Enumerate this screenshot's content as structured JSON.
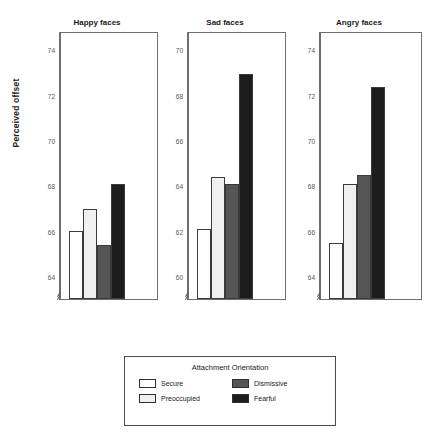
{
  "chart_data": {
    "type": "bar",
    "title": "",
    "xlabel": "",
    "ylabel": "Perceived offset",
    "grid": false,
    "legend_position": "bottom",
    "legend_title": "Attachment Orientation",
    "categories": [
      "Happy faces",
      "Sad faces",
      "Angry faces"
    ],
    "series": [
      {
        "name": "Secure",
        "values": [
          66.0,
          62.1,
          65.5
        ],
        "fill": "white",
        "color": "#ffffff"
      },
      {
        "name": "Preoccupied",
        "values": [
          67.0,
          64.4,
          68.1
        ],
        "fill": "light-stipple",
        "color": "#f0f0f0"
      },
      {
        "name": "Dismissive",
        "values": [
          65.4,
          64.1,
          68.5
        ],
        "fill": "gray-stipple",
        "color": "#9a9a9a"
      },
      {
        "name": "Fearful",
        "values": [
          68.1,
          69.0,
          72.4
        ],
        "fill": "dark-stipple",
        "color": "#1d1d1d"
      }
    ],
    "panels": [
      {
        "label": "Happy faces",
        "ylim": [
          63.0,
          74.8
        ],
        "yticks": [
          64,
          66,
          68,
          70,
          72,
          74
        ],
        "yticklabels": [
          "64",
          "66",
          "68",
          "70",
          "72",
          "74"
        ],
        "minor_ticks": [
          65,
          67,
          69,
          71,
          73
        ],
        "axis_break": true,
        "values": {
          "Secure": 66.0,
          "Preoccupied": 67.0,
          "Dismissive": 65.4,
          "Fearful": 68.1
        }
      },
      {
        "label": "Sad faces",
        "ylim": [
          59.0,
          70.8
        ],
        "yticks": [
          60,
          62,
          64,
          66,
          68,
          70
        ],
        "yticklabels": [
          "60",
          "62",
          "64",
          "66",
          "68",
          "70"
        ],
        "minor_ticks": [
          61,
          63,
          65,
          67,
          69
        ],
        "axis_break": true,
        "values": {
          "Secure": 62.1,
          "Preoccupied": 64.4,
          "Dismissive": 64.1,
          "Fearful": 69.0
        }
      },
      {
        "label": "Angry faces",
        "ylim": [
          63.0,
          74.8
        ],
        "yticks": [
          64,
          66,
          68,
          70,
          72,
          74
        ],
        "yticklabels": [
          "64",
          "66",
          "68",
          "70",
          "72",
          "74"
        ],
        "minor_ticks": [
          65,
          67,
          69,
          71,
          73
        ],
        "axis_break": true,
        "values": {
          "Secure": 65.5,
          "Preoccupied": 68.1,
          "Dismissive": 68.5,
          "Fearful": 72.4
        }
      }
    ]
  },
  "figure": {
    "ylabel": "Perceived offset"
  },
  "legend": {
    "title": "Attachment Orientation",
    "items": [
      {
        "label": "Secure",
        "swatch": "swatch-secure"
      },
      {
        "label": "Dismissive",
        "swatch": "swatch-dismissive"
      },
      {
        "label": "Preoccupied",
        "swatch": "swatch-preoccupied"
      },
      {
        "label": "Fearful",
        "swatch": "swatch-fearful"
      }
    ]
  }
}
